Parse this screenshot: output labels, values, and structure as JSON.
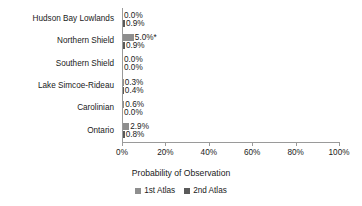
{
  "chart_data": {
    "type": "bar",
    "orientation": "horizontal",
    "title": "",
    "xlabel": "Probability of Observation",
    "ylabel": "",
    "xlim": [
      0,
      100
    ],
    "xtick_labels": [
      "0%",
      "20%",
      "40%",
      "60%",
      "80%",
      "100%"
    ],
    "xticks": [
      0,
      20,
      40,
      60,
      80,
      100
    ],
    "grid": false,
    "legend_position": "bottom",
    "categories": [
      "Hudson Bay Lowlands",
      "Northern Shield",
      "Southern Shield",
      "Lake Simcoe-Rideau",
      "Carolinian",
      "Ontario"
    ],
    "series": [
      {
        "name": "1st Atlas",
        "color": "#8e8e8e",
        "values": [
          0.0,
          5.0,
          0.0,
          0.3,
          0.6,
          2.9
        ],
        "labels": [
          "0.0%",
          "5.0%*",
          "0.0%",
          "0.3%",
          "0.6%",
          "2.9%"
        ]
      },
      {
        "name": "2nd Atlas",
        "color": "#5a5a5a",
        "values": [
          0.9,
          0.9,
          0.0,
          0.4,
          0.0,
          0.8
        ],
        "labels": [
          "0.9%",
          "0.9%",
          "0.0%",
          "0.4%",
          "0.0%",
          "0.8%"
        ]
      }
    ],
    "annotations": [
      "* denotes value marked with asterisk on Northern Shield 1st Atlas bar"
    ]
  }
}
